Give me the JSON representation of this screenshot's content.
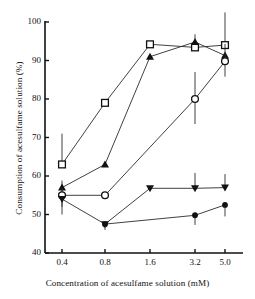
{
  "chart_data": {
    "type": "line",
    "title": "",
    "xlabel": "Concentration of acesulfame solution (mM)",
    "ylabel": "Consumption of acesulfame solution (%)",
    "categories": [
      "0.4",
      "0.8",
      "1.6",
      "3.2",
      "5.0"
    ],
    "x_tick_labels": [
      "0.4",
      "0.8",
      "1.6",
      "3.2",
      "5.0"
    ],
    "y_tick_labels": [
      "40",
      "50",
      "60",
      "70",
      "80",
      "90",
      "100"
    ],
    "ylim": [
      40,
      100
    ],
    "y_tick_step": 10,
    "grid": false,
    "legend": "none",
    "axis_style": "open-left-bottom",
    "series": [
      {
        "name": "open-square",
        "marker": "open-square",
        "values": [
          63.0,
          79.0,
          94.2,
          93.4,
          94.0
        ],
        "errors_up": [
          8.0,
          0,
          0,
          0,
          8.5
        ],
        "errors_down": [
          0,
          0,
          0,
          0,
          0
        ]
      },
      {
        "name": "filled-triangle-up",
        "marker": "filled-triangle-up",
        "values": [
          57.0,
          63.0,
          91.0,
          94.8,
          91.3
        ],
        "errors_up": [
          1.8,
          0,
          0,
          2.0,
          0
        ],
        "errors_down": [
          1.5,
          0,
          0,
          0,
          0
        ]
      },
      {
        "name": "open-circle",
        "marker": "open-circle",
        "values": [
          55.0,
          55.0,
          null,
          80.0,
          89.8
        ],
        "errors_up": [
          2.0,
          0,
          0,
          7.0,
          4.5
        ],
        "errors_down": [
          3.0,
          0,
          0,
          6.5,
          4.0
        ]
      },
      {
        "name": "filled-triangle-down",
        "marker": "filled-triangle-down",
        "values": [
          54.0,
          47.5,
          56.8,
          56.8,
          57.0
        ],
        "errors_up": [
          0,
          0,
          0,
          4.0,
          3.5
        ],
        "errors_down": [
          4.0,
          1.5,
          0,
          0,
          0
        ]
      },
      {
        "name": "filled-circle",
        "marker": "filled-circle",
        "values": [
          null,
          47.5,
          null,
          49.8,
          52.5
        ],
        "errors_up": [
          0,
          0,
          0,
          0,
          0
        ],
        "errors_down": [
          0,
          0,
          0,
          2.5,
          3.0
        ]
      }
    ]
  }
}
